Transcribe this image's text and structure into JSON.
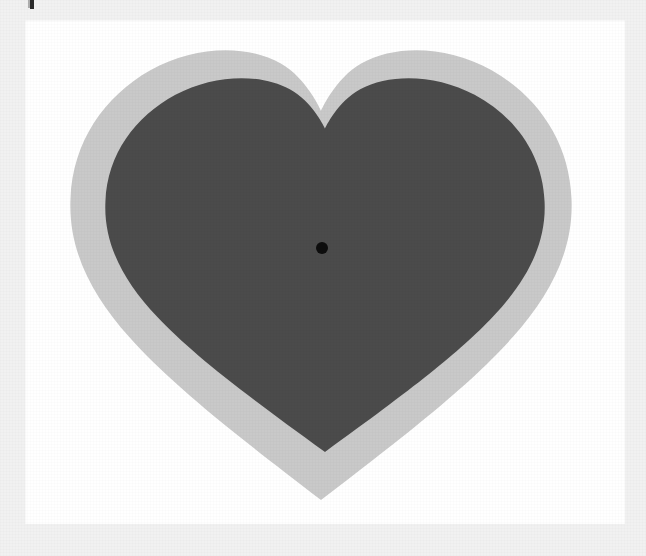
{
  "figure": {
    "title": "Heart shape with offset outline and center point",
    "caption": "",
    "canvas": {
      "width": 646,
      "height": 556,
      "background_color": "#f1f1f1"
    },
    "card": {
      "label": "white-backdrop",
      "x": 25,
      "y": 20,
      "width": 600,
      "height": 504,
      "fill_color": "#ffffff"
    }
  },
  "shapes": [
    {
      "id": "outer-heart",
      "name": "light-gray-heart",
      "role": "offset outline / shadow copy",
      "fill_color": "#c9c9c9",
      "bounds": {
        "left": 70,
        "top": 50,
        "right": 572,
        "bottom": 500
      },
      "cleft_y": 50,
      "tip": {
        "x": 321,
        "y": 500
      }
    },
    {
      "id": "inner-heart",
      "name": "dark-gray-heart",
      "role": "primary shape",
      "fill_color": "#4b4b4b",
      "bounds": {
        "left": 105,
        "top": 78,
        "right": 545,
        "bottom": 452
      },
      "cleft_y": 78,
      "tip": {
        "x": 321,
        "y": 452
      }
    }
  ],
  "markers": [
    {
      "id": "center-dot",
      "name": "centroid-marker",
      "shape": "circle",
      "fill_color": "#0d0d0d",
      "cx": 322,
      "cy": 248,
      "radius": 6
    }
  ],
  "artifacts": [
    {
      "id": "edge-tick",
      "name": "top-edge-scan-mark",
      "description": "small dark vertical mark at the top edge",
      "x": 30,
      "y": 0,
      "width": 4,
      "height": 9,
      "color": "#2a2a2a"
    }
  ],
  "palette": {
    "background": "#f1f1f1",
    "card": "#ffffff",
    "outer_heart": "#c9c9c9",
    "inner_heart": "#4b4b4b",
    "marker": "#0d0d0d"
  }
}
